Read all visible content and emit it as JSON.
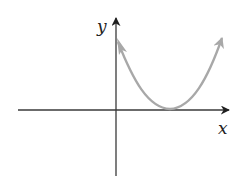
{
  "diagram": {
    "type": "function-graph",
    "axes": {
      "x_label": "x",
      "y_label": "y",
      "color": "#2a2a2a"
    },
    "curve": {
      "shape": "parabola",
      "vertex": "on positive x-axis",
      "arrows": "both ends",
      "color": "#a8a8a8"
    }
  }
}
